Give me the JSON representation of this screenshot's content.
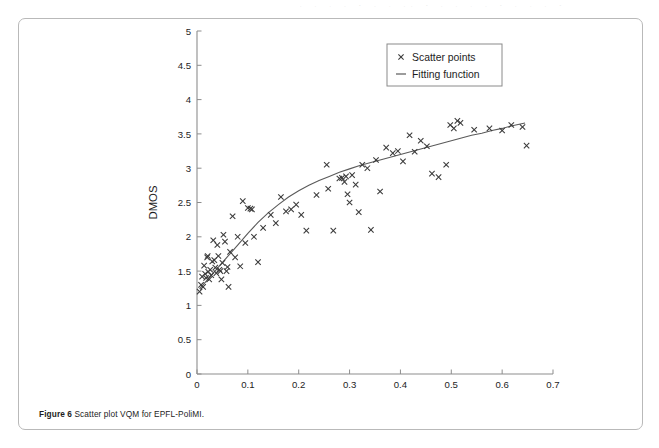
{
  "caption": {
    "label": "Figure 6",
    "text": "Scatter plot VQM for EPFL-PoliMI."
  },
  "scan_artifact": ". . , . - . , .. - . .  ,  .   -   .  , .  -",
  "colors": {
    "axis": "#8d8d8d",
    "marker": "#3a3a3a",
    "fit_line": "#5a5a5a",
    "legend_border": "#8a8a8a",
    "frame": "#b9b9b9",
    "text": "#1d1d1d"
  },
  "legend": {
    "position": "top-right",
    "entries": [
      {
        "label": "Scatter points",
        "marker": "x"
      },
      {
        "label": "Fitting function",
        "marker": "line"
      }
    ]
  },
  "chart_data": {
    "type": "scatter",
    "title": "",
    "subtitle": "",
    "xlabel": "VQM",
    "ylabel": "DMOS",
    "xlim": [
      0,
      0.7
    ],
    "ylim": [
      0,
      5
    ],
    "xticks": [
      0,
      0.1,
      0.2,
      0.3,
      0.4,
      0.5,
      0.6,
      0.7
    ],
    "xtick_labels": [
      "0",
      "0.1",
      "0.2",
      "0.3",
      "0.4",
      "0.5",
      "0.6",
      "0.7"
    ],
    "yticks": [
      0,
      0.5,
      1,
      1.5,
      2,
      2.5,
      3,
      3.5,
      4,
      4.5,
      5
    ],
    "ytick_labels": [
      "0",
      "0.5",
      "1",
      "1.5",
      "2",
      "2.5",
      "3",
      "3.5",
      "4",
      "4.5",
      "5"
    ],
    "grid": false,
    "legend": [
      "Scatter points",
      "Fitting function"
    ],
    "annotations": [],
    "series": [
      {
        "name": "Scatter points",
        "type": "scatter",
        "marker": "x",
        "points": [
          [
            0.005,
            1.2
          ],
          [
            0.008,
            1.3
          ],
          [
            0.01,
            1.42
          ],
          [
            0.012,
            1.27
          ],
          [
            0.014,
            1.58
          ],
          [
            0.016,
            1.46
          ],
          [
            0.018,
            1.4
          ],
          [
            0.02,
            1.7
          ],
          [
            0.021,
            1.72
          ],
          [
            0.022,
            1.49
          ],
          [
            0.024,
            1.38
          ],
          [
            0.026,
            1.52
          ],
          [
            0.028,
            1.44
          ],
          [
            0.03,
            1.64
          ],
          [
            0.032,
            1.95
          ],
          [
            0.034,
            1.66
          ],
          [
            0.036,
            1.55
          ],
          [
            0.038,
            1.47
          ],
          [
            0.04,
            1.88
          ],
          [
            0.042,
            1.72
          ],
          [
            0.044,
            1.52
          ],
          [
            0.046,
            1.5
          ],
          [
            0.048,
            1.38
          ],
          [
            0.05,
            1.62
          ],
          [
            0.052,
            2.03
          ],
          [
            0.055,
            1.93
          ],
          [
            0.058,
            1.5
          ],
          [
            0.06,
            1.56
          ],
          [
            0.062,
            1.27
          ],
          [
            0.065,
            1.78
          ],
          [
            0.07,
            2.3
          ],
          [
            0.075,
            1.7
          ],
          [
            0.08,
            2.0
          ],
          [
            0.085,
            1.57
          ],
          [
            0.09,
            2.52
          ],
          [
            0.095,
            1.91
          ],
          [
            0.1,
            2.42
          ],
          [
            0.105,
            2.41
          ],
          [
            0.108,
            2.4
          ],
          [
            0.112,
            2.0
          ],
          [
            0.12,
            1.63
          ],
          [
            0.13,
            2.13
          ],
          [
            0.145,
            2.32
          ],
          [
            0.155,
            2.2
          ],
          [
            0.165,
            2.58
          ],
          [
            0.175,
            2.37
          ],
          [
            0.185,
            2.4
          ],
          [
            0.195,
            2.47
          ],
          [
            0.205,
            2.32
          ],
          [
            0.215,
            2.09
          ],
          [
            0.235,
            2.61
          ],
          [
            0.255,
            3.05
          ],
          [
            0.258,
            2.7
          ],
          [
            0.268,
            2.09
          ],
          [
            0.28,
            2.85
          ],
          [
            0.285,
            2.86
          ],
          [
            0.29,
            2.8
          ],
          [
            0.293,
            2.88
          ],
          [
            0.296,
            2.62
          ],
          [
            0.3,
            2.5
          ],
          [
            0.305,
            2.9
          ],
          [
            0.312,
            2.76
          ],
          [
            0.318,
            2.36
          ],
          [
            0.325,
            3.05
          ],
          [
            0.335,
            3.0
          ],
          [
            0.342,
            2.1
          ],
          [
            0.352,
            3.12
          ],
          [
            0.36,
            2.66
          ],
          [
            0.372,
            3.3
          ],
          [
            0.385,
            3.22
          ],
          [
            0.395,
            3.25
          ],
          [
            0.405,
            3.1
          ],
          [
            0.418,
            3.48
          ],
          [
            0.428,
            3.24
          ],
          [
            0.44,
            3.4
          ],
          [
            0.452,
            3.32
          ],
          [
            0.462,
            2.92
          ],
          [
            0.475,
            2.87
          ],
          [
            0.49,
            3.05
          ],
          [
            0.498,
            3.63
          ],
          [
            0.505,
            3.58
          ],
          [
            0.512,
            3.69
          ],
          [
            0.518,
            3.66
          ],
          [
            0.545,
            3.56
          ],
          [
            0.575,
            3.58
          ],
          [
            0.6,
            3.55
          ],
          [
            0.618,
            3.63
          ],
          [
            0.64,
            3.6
          ],
          [
            0.648,
            3.33
          ]
        ]
      },
      {
        "name": "Fitting function",
        "type": "line",
        "points": [
          [
            0.005,
            1.24
          ],
          [
            0.02,
            1.37
          ],
          [
            0.04,
            1.54
          ],
          [
            0.06,
            1.71
          ],
          [
            0.08,
            1.88
          ],
          [
            0.1,
            2.05
          ],
          [
            0.12,
            2.21
          ],
          [
            0.14,
            2.35
          ],
          [
            0.16,
            2.47
          ],
          [
            0.18,
            2.58
          ],
          [
            0.2,
            2.67
          ],
          [
            0.22,
            2.75
          ],
          [
            0.24,
            2.82
          ],
          [
            0.26,
            2.88
          ],
          [
            0.28,
            2.94
          ],
          [
            0.3,
            2.99
          ],
          [
            0.32,
            3.04
          ],
          [
            0.34,
            3.08
          ],
          [
            0.36,
            3.12
          ],
          [
            0.38,
            3.16
          ],
          [
            0.4,
            3.2
          ],
          [
            0.42,
            3.24
          ],
          [
            0.44,
            3.28
          ],
          [
            0.46,
            3.32
          ],
          [
            0.48,
            3.36
          ],
          [
            0.5,
            3.4
          ],
          [
            0.52,
            3.44
          ],
          [
            0.54,
            3.48
          ],
          [
            0.56,
            3.51
          ],
          [
            0.58,
            3.55
          ],
          [
            0.6,
            3.58
          ],
          [
            0.62,
            3.62
          ],
          [
            0.645,
            3.66
          ]
        ]
      }
    ]
  }
}
